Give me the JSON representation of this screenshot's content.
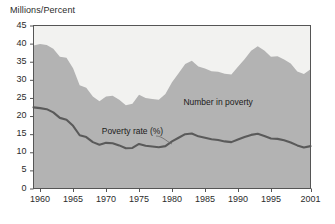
{
  "chart_data": {
    "type": "area",
    "title": "",
    "ylabel": "Millions/Percent",
    "xlabel": "",
    "ylim": [
      0,
      45
    ],
    "xlim": [
      1959,
      2001
    ],
    "grid": false,
    "legend_position": "inline-annotations",
    "yticks": [
      0,
      5,
      10,
      15,
      20,
      25,
      30,
      35,
      40,
      45
    ],
    "ytick_labels": [
      "0",
      "5",
      "10",
      "15",
      "20",
      "25",
      "30",
      "35",
      "40",
      "45"
    ],
    "xticks": [
      1960,
      1965,
      1970,
      1975,
      1980,
      1985,
      1990,
      1995,
      2001
    ],
    "xtick_labels": [
      "1960",
      "1965",
      "1970",
      "1975",
      "1980",
      "1985",
      "1990",
      "1995",
      "2001"
    ],
    "x": [
      1959,
      1960,
      1961,
      1962,
      1963,
      1964,
      1965,
      1966,
      1967,
      1968,
      1969,
      1970,
      1971,
      1972,
      1973,
      1974,
      1975,
      1976,
      1977,
      1978,
      1979,
      1980,
      1981,
      1982,
      1983,
      1984,
      1985,
      1986,
      1987,
      1988,
      1989,
      1990,
      1991,
      1992,
      1993,
      1994,
      1995,
      1996,
      1997,
      1998,
      1999,
      2000,
      2001
    ],
    "series": [
      {
        "name": "Number in poverty",
        "units": "millions",
        "render": "area",
        "color": "#b3b3b3",
        "values": [
          39.5,
          39.9,
          39.6,
          38.6,
          36.4,
          36.1,
          33.2,
          28.5,
          27.8,
          25.4,
          24.1,
          25.4,
          25.6,
          24.5,
          23.0,
          23.4,
          25.9,
          25.0,
          24.7,
          24.5,
          26.1,
          29.3,
          31.8,
          34.4,
          35.3,
          33.7,
          33.1,
          32.4,
          32.2,
          31.7,
          31.5,
          33.6,
          35.7,
          38.0,
          39.3,
          38.1,
          36.4,
          36.5,
          35.6,
          34.5,
          32.3,
          31.6,
          32.9
        ]
      },
      {
        "name": "Poverty rate (%)",
        "units": "percent",
        "render": "line",
        "color": "#5a5a5a",
        "values": [
          22.4,
          22.2,
          21.9,
          21.0,
          19.5,
          19.0,
          17.3,
          14.7,
          14.2,
          12.8,
          12.1,
          12.6,
          12.5,
          11.9,
          11.1,
          11.2,
          12.3,
          11.8,
          11.6,
          11.4,
          11.7,
          13.0,
          14.0,
          15.0,
          15.2,
          14.4,
          14.0,
          13.6,
          13.4,
          13.0,
          12.8,
          13.5,
          14.2,
          14.8,
          15.1,
          14.5,
          13.8,
          13.7,
          13.3,
          12.7,
          11.9,
          11.3,
          11.7
        ]
      }
    ],
    "annotations": [
      {
        "text": "Number in poverty",
        "x": 1987,
        "y": 23.5
      },
      {
        "text": "Poverty rate (%)",
        "x": 1974,
        "y": 15.5
      }
    ]
  },
  "colors": {
    "area_fill": "#b3b3b3",
    "line": "#5a5a5a",
    "axis": "#555555",
    "text": "#2b2b2b",
    "background": "#ffffff",
    "plot_background": "#f2f2f0"
  }
}
